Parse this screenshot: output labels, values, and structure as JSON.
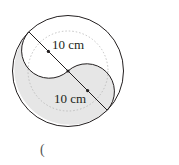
{
  "diagram": {
    "type": "geometry-figure",
    "labels": {
      "upper_radius": "10 cm",
      "lower_radius": "10 cm"
    },
    "answer_bracket": "(",
    "colors": {
      "shade": "#e6e6e6",
      "stroke": "#231f20",
      "dotted": "#b5b5b5"
    }
  }
}
